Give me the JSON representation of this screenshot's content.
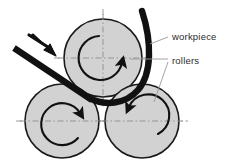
{
  "figure": {
    "type": "technical-diagram",
    "background_color": "#ffffff"
  },
  "colors": {
    "roller_fill": "#d2d2d2",
    "roller_stroke": "#1a1a1a",
    "workpiece": "#111111",
    "centerline": "#8a8a8a",
    "leader_line": "#9a9a9a",
    "label_text": "#2b2b2b",
    "arrow": "#111111"
  },
  "labels": [
    {
      "id": "workpiece",
      "text": "workpiece",
      "x": 172,
      "y": 40
    },
    {
      "id": "rollers",
      "text": "rollers",
      "x": 172,
      "y": 63
    }
  ],
  "rollers": [
    {
      "id": "top-roller",
      "name": "top roller",
      "cx": 103,
      "cy": 58,
      "r": 39,
      "rotation": "clockwise",
      "rotation_symbol": "↻"
    },
    {
      "id": "bottom-left-roller",
      "name": "bottom left roller",
      "cx": 62,
      "cy": 121,
      "r": 37,
      "rotation": "clockwise",
      "rotation_symbol": "↻"
    },
    {
      "id": "bottom-right-roller",
      "name": "bottom right roller",
      "cx": 142,
      "cy": 121,
      "r": 37,
      "rotation": "counter-clockwise",
      "rotation_symbol": "↺"
    }
  ],
  "workpiece": {
    "id": "workpiece-bar",
    "name": "metal bar being bent",
    "entry_label": "feed direction",
    "feed_arrow_symbol": "→",
    "stroke_width": 6
  },
  "leaders": [
    {
      "id": "leader-workpiece",
      "from_x": 168,
      "from_y": 37,
      "to_x": 150,
      "to_y": 44
    },
    {
      "id": "leader-rollers-top",
      "from_x": 168,
      "from_y": 60,
      "to_x": 131,
      "to_y": 60
    },
    {
      "id": "leader-rollers-bottom",
      "from_x": 168,
      "from_y": 64,
      "to_x": 155,
      "to_y": 101
    }
  ]
}
